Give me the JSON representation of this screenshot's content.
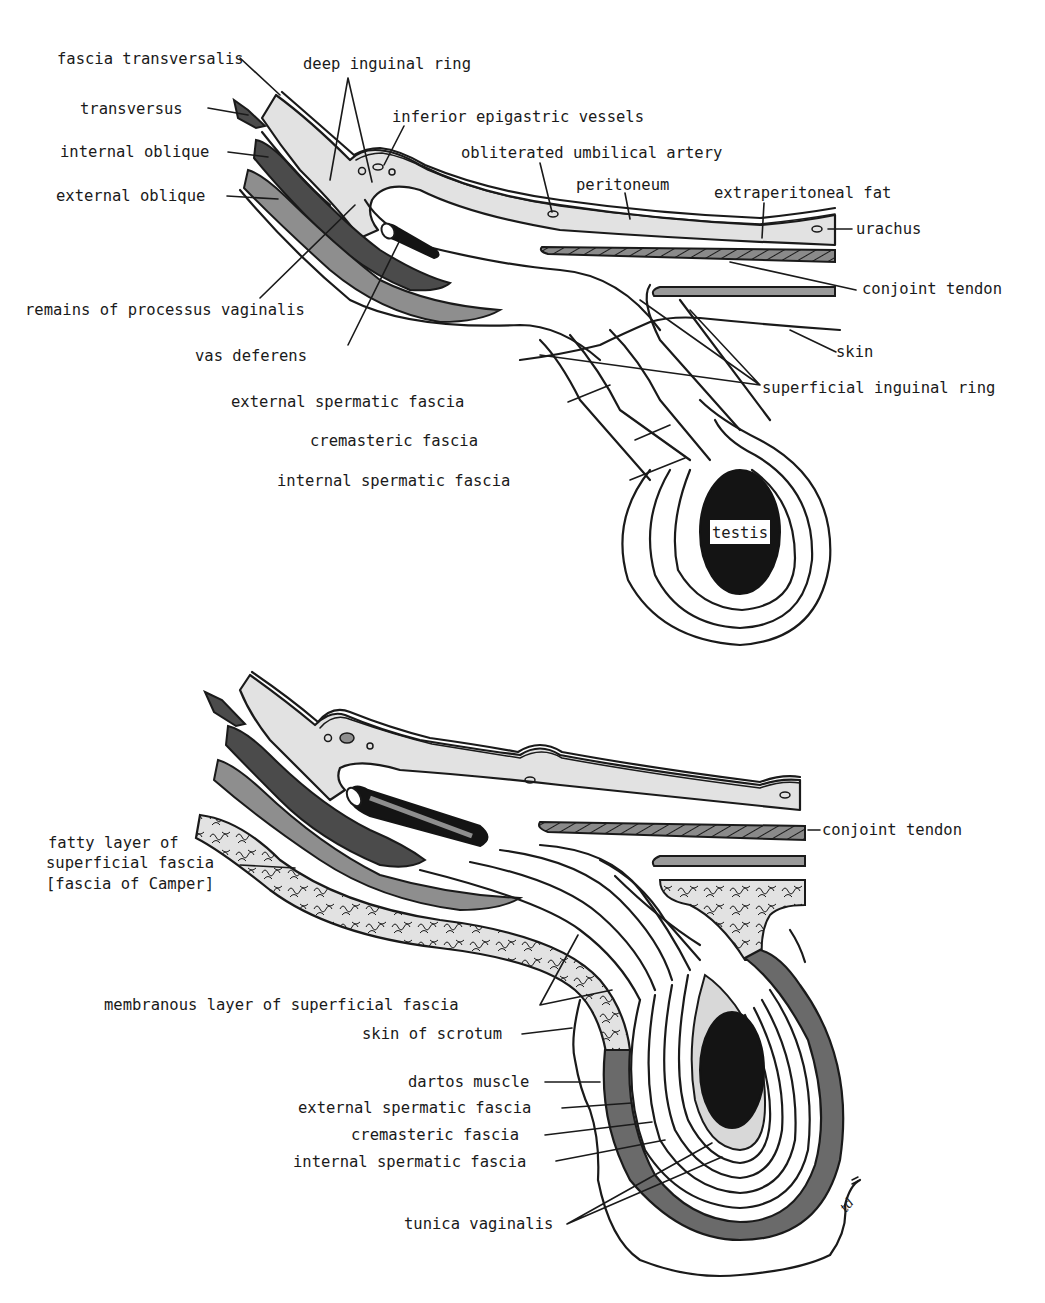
{
  "figure": {
    "signature": "td"
  },
  "top_diagram": {
    "labels": {
      "fascia_transversalis": "fascia transversalis",
      "deep_inguinal_ring": "deep inguinal ring",
      "transversus": "transversus",
      "inferior_epigastric_vessels": "inferior epigastric vessels",
      "internal_oblique": "internal oblique",
      "obliterated_umbilical_artery": "obliterated umbilical artery",
      "peritoneum": "peritoneum",
      "external_oblique": "external oblique",
      "extraperitoneal_fat": "extraperitoneal fat",
      "urachus": "urachus",
      "conjoint_tendon": "conjoint tendon",
      "remains_of_processus_vaginalis": "remains of processus vaginalis",
      "vas_deferens": "vas deferens",
      "skin": "skin",
      "external_spermatic_fascia": "external spermatic fascia",
      "superficial_inguinal_ring": "superficial inguinal ring",
      "cremasteric_fascia": "cremasteric fascia",
      "internal_spermatic_fascia": "internal spermatic fascia",
      "testis": "testis"
    }
  },
  "bottom_diagram": {
    "labels": {
      "conjoint_tendon": "conjoint tendon",
      "fatty_layer_line1": "fatty layer of",
      "fatty_layer_line2": "superficial fascia",
      "fatty_layer_line3": "[fascia of Camper]",
      "membranous_layer": "membranous layer of superficial fascia",
      "skin_of_scrotum": "skin of scrotum",
      "dartos_muscle": "dartos muscle",
      "external_spermatic_fascia": "external spermatic fascia",
      "cremasteric_fascia": "cremasteric fascia",
      "internal_spermatic_fascia": "internal spermatic fascia",
      "tunica_vaginalis": "tunica vaginalis"
    }
  },
  "colors": {
    "background": "#ffffff",
    "ink": "#1a1a1a",
    "light_gray": "#e2e2e2",
    "mid_gray": "#8e8e8e",
    "dark_gray": "#4b4b4b",
    "black": "#141414"
  }
}
